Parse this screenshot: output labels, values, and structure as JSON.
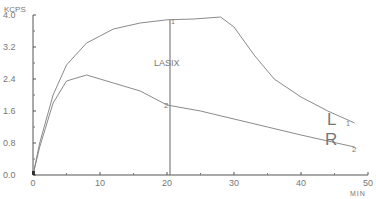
{
  "chart_data": {
    "type": "line",
    "title": "",
    "xlabel": "MIN",
    "ylabel": "KCPS",
    "xlim": [
      0,
      50
    ],
    "ylim": [
      0,
      4.0
    ],
    "x_ticks": [
      "0",
      "10",
      "20",
      "30",
      "40",
      "50"
    ],
    "y_ticks": [
      "0.0",
      "0.8",
      "1.6",
      "2.4",
      "3.2",
      "4.0"
    ],
    "grid": false,
    "annotations": [
      {
        "text": "LASIX",
        "x": 20,
        "type": "vertical-line"
      },
      {
        "text": "L",
        "series": "L"
      },
      {
        "text": "R",
        "series": "R"
      },
      {
        "text": "1",
        "note": "marker on curve L"
      },
      {
        "text": "2",
        "note": "marker on curve R"
      }
    ],
    "series": [
      {
        "name": "L",
        "x": [
          0,
          1,
          3,
          5,
          8,
          12,
          16,
          20,
          24,
          28,
          30,
          33,
          36,
          40,
          44,
          48
        ],
        "values": [
          0,
          0.8,
          2.0,
          2.75,
          3.3,
          3.65,
          3.8,
          3.88,
          3.9,
          3.95,
          3.7,
          3.0,
          2.4,
          1.95,
          1.6,
          1.3
        ]
      },
      {
        "name": "R",
        "x": [
          0,
          1,
          3,
          5,
          8,
          12,
          16,
          20,
          25,
          30,
          35,
          40,
          44,
          48
        ],
        "values": [
          0,
          0.7,
          1.8,
          2.35,
          2.5,
          2.3,
          2.1,
          1.75,
          1.6,
          1.4,
          1.2,
          1.0,
          0.85,
          0.7
        ]
      }
    ]
  },
  "labels": {
    "ylabel": "KCPS",
    "xlabel": "MIN",
    "lasix": "LASIX",
    "curve_L": "L",
    "curve_R": "R",
    "marker_1": "1",
    "marker_2": "2"
  },
  "colors": {
    "line": "#8a8a8a",
    "axis": "#555555",
    "text": "#777777"
  }
}
